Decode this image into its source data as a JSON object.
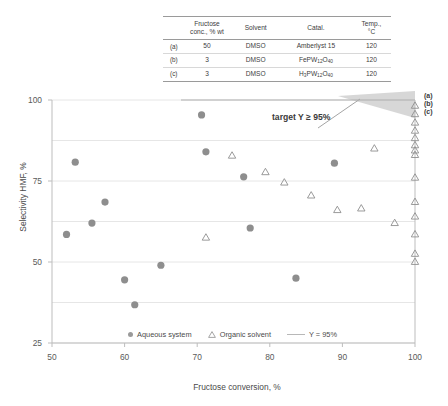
{
  "chart_data": {
    "type": "scatter",
    "title": "",
    "xlabel": "Fructose conversion, %",
    "ylabel": "Selectivity HMF, %",
    "xlim": [
      50,
      100
    ],
    "ylim": [
      25,
      100
    ],
    "xticks": [
      50,
      60,
      70,
      80,
      90,
      100
    ],
    "yticks": [
      25,
      50,
      75,
      100
    ],
    "grid": true,
    "legend_position": "bottom",
    "annotation": "target Y ≥ 95%",
    "reference_line": {
      "label": "Y = 95%",
      "value": 95,
      "orientation": "horizontal"
    },
    "series": [
      {
        "name": "Aqueous system",
        "marker": "filled-circle",
        "color": "#8e8e8e",
        "points": [
          [
            52.0,
            58.5
          ],
          [
            53.2,
            80.8
          ],
          [
            55.5,
            62.0
          ],
          [
            57.3,
            68.5
          ],
          [
            60.0,
            44.5
          ],
          [
            61.4,
            36.8
          ],
          [
            65.0,
            49.0
          ],
          [
            70.6,
            95.4
          ],
          [
            71.2,
            84.0
          ],
          [
            76.4,
            76.3
          ],
          [
            77.3,
            60.5
          ],
          [
            83.6,
            45.0
          ],
          [
            88.9,
            80.5
          ]
        ]
      },
      {
        "name": "Organic solvent",
        "marker": "open-triangle",
        "color": "#8e8e8e",
        "points": [
          [
            71.2,
            57.5
          ],
          [
            74.8,
            82.8
          ],
          [
            79.4,
            77.7
          ],
          [
            82.0,
            74.5
          ],
          [
            85.7,
            70.5
          ],
          [
            89.3,
            66.0
          ],
          [
            92.6,
            66.5
          ],
          [
            94.4,
            85.0
          ],
          [
            97.2,
            62.0
          ],
          [
            100.0,
            98.2
          ],
          [
            100.0,
            95.6
          ],
          [
            100.0,
            93.0
          ],
          [
            100.0,
            90.5
          ],
          [
            100.0,
            88.2
          ],
          [
            100.0,
            86.0
          ],
          [
            100.0,
            84.4
          ],
          [
            100.0,
            83.0
          ],
          [
            100.0,
            76.0
          ],
          [
            100.0,
            68.5
          ],
          [
            100.0,
            64.0
          ],
          [
            100.0,
            58.5
          ],
          [
            100.0,
            52.5
          ],
          [
            100.0,
            50.0
          ]
        ]
      }
    ],
    "point_labels": [
      {
        "label": "(a)",
        "x": 100.0,
        "y": 98.2
      },
      {
        "label": "(b)",
        "x": 100.0,
        "y": 95.6
      },
      {
        "label": "(c)",
        "x": 100.0,
        "y": 93.0
      }
    ]
  },
  "table": {
    "headers": [
      "",
      "Fructose conc., % wt",
      "Solvent",
      "Catal.",
      "Temp., °C"
    ],
    "header_lines": {
      "conc_line1": "Fructose",
      "conc_line2": "conc., % wt",
      "solvent": "Solvent",
      "catal": "Catal.",
      "temp_line1": "Temp.,",
      "temp_line2": "°C"
    },
    "rows": [
      {
        "label": "(a)",
        "conc": "50",
        "solvent": "DMSO",
        "catalyst": "Amberlyst 15",
        "catalyst_parts": null,
        "temp": "120"
      },
      {
        "label": "(b)",
        "conc": "3",
        "solvent": "DMSO",
        "catalyst": "FePW12O40",
        "catalyst_parts": {
          "p1": "FePW",
          "s1": "12",
          "p2": "O",
          "s2": "40"
        },
        "temp": "120"
      },
      {
        "label": "(c)",
        "conc": "3",
        "solvent": "DMSO",
        "catalyst": "H3PW12O40",
        "catalyst_parts": {
          "p0": "H",
          "s0": "3",
          "p1": "PW",
          "s1": "12",
          "p2": "O",
          "s2": "40"
        },
        "temp": "120"
      }
    ]
  },
  "legend": {
    "aqueous": "Aqueous system",
    "organic": "Organic solvent",
    "line": "Y = 95%"
  },
  "colors": {
    "marker": "#8e8e8e",
    "grid": "#e3e3e3",
    "axis": "#bdbdbd",
    "target_fill": "#c9c9c9",
    "text": "#4a4a4a"
  }
}
